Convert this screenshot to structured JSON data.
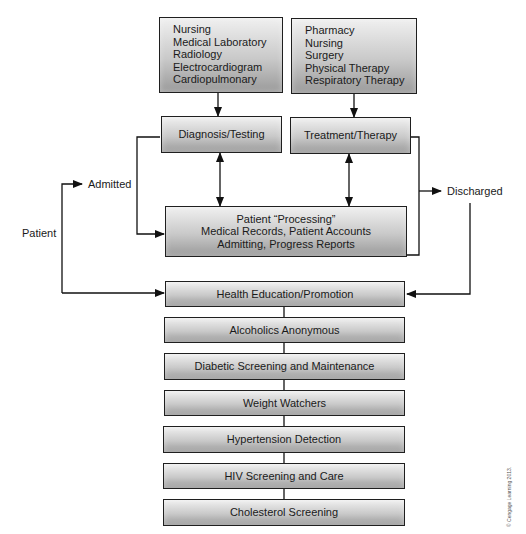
{
  "diagram": {
    "top_left_box": {
      "items": [
        "Nursing",
        "Medical Laboratory",
        "Radiology",
        "Electrocardiogram",
        "Cardiopulmonary"
      ]
    },
    "top_right_box": {
      "items": [
        "Pharmacy",
        "Nursing",
        "Surgery",
        "Physical Therapy",
        "Respiratory Therapy"
      ]
    },
    "diagnosis_box": "Diagnosis/Testing",
    "treatment_box": "Treatment/Therapy",
    "processing_box": {
      "line1": "Patient “Processing”",
      "line2": "Medical Records, Patient Accounts",
      "line3": "Admitting, Progress Reports"
    },
    "labels": {
      "patient": "Patient",
      "admitted": "Admitted",
      "discharged": "Discharged"
    },
    "programs": [
      "Health Education/Promotion",
      "Alcoholics Anonymous",
      "Diabetic Screening and Maintenance",
      "Weight Watchers",
      "Hypertension Detection",
      "HIV Screening and Care",
      "Cholesterol Screening"
    ],
    "copyright": "© Cengage Learning 2013."
  }
}
